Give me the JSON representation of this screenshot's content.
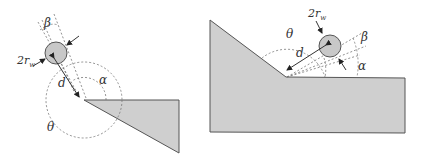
{
  "colors": {
    "fill_gray": "#cfcfcf",
    "stroke": "#444444",
    "dashed": "#666666",
    "text": "#333333",
    "background": "#ffffff"
  },
  "left_diagram": {
    "labels": {
      "beta": "β",
      "radius_prefix": "2r",
      "radius_sub": "w",
      "distance": "d",
      "alpha": "α",
      "theta": "θ"
    }
  },
  "right_diagram": {
    "labels": {
      "beta": "β",
      "radius_prefix": "2r",
      "radius_sub": "w",
      "distance": "d",
      "alpha": "α",
      "theta": "θ"
    }
  }
}
